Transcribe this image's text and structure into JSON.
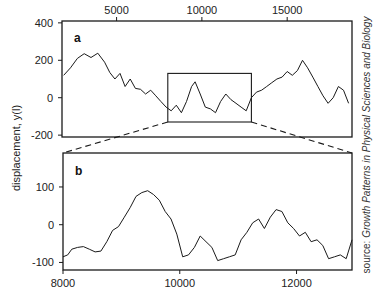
{
  "chart_data": [
    {
      "panel": "a",
      "type": "line",
      "title": "",
      "xlabel": "",
      "ylabel": "displacement, y(l)",
      "x_ticks": [
        5000,
        10000,
        15000
      ],
      "x_tick_labels": [
        "5000",
        "10000",
        "15000"
      ],
      "x_axis_position": "top",
      "y_ticks": [
        400,
        200,
        0,
        -200
      ],
      "y_tick_labels": [
        "400",
        "200",
        "0",
        "-200"
      ],
      "xlim": [
        1800,
        18800
      ],
      "ylim": [
        -210,
        410
      ],
      "grid": false,
      "inset_box": {
        "x_range": [
          8000,
          12900
        ],
        "y_range": [
          -130,
          130
        ]
      },
      "x": [
        1900,
        2300,
        2700,
        3100,
        3500,
        3900,
        4300,
        4600,
        4900,
        5200,
        5500,
        5800,
        6100,
        6400,
        6700,
        7000,
        7300,
        7600,
        7900,
        8200,
        8500,
        8800,
        9100,
        9400,
        9600,
        9900,
        10200,
        10500,
        10800,
        11100,
        11400,
        11700,
        12000,
        12300,
        12600,
        12900,
        13200,
        13500,
        13800,
        14100,
        14400,
        14700,
        15000,
        15300,
        15600,
        15900,
        16200,
        16500,
        16800,
        17100,
        17400,
        17700,
        18000,
        18300,
        18600
      ],
      "y": [
        120,
        160,
        210,
        235,
        215,
        238,
        190,
        135,
        100,
        130,
        60,
        100,
        50,
        45,
        20,
        40,
        10,
        -20,
        -50,
        -70,
        -40,
        -80,
        -20,
        60,
        85,
        20,
        -50,
        -60,
        -80,
        -20,
        20,
        -10,
        -30,
        -50,
        -70,
        0,
        30,
        40,
        60,
        80,
        100,
        110,
        140,
        120,
        145,
        200,
        160,
        110,
        60,
        10,
        -30,
        0,
        60,
        40,
        -30
      ]
    },
    {
      "panel": "b",
      "type": "line",
      "title": "",
      "xlabel": "",
      "ylabel": "displacement, y(l)",
      "x_ticks": [
        8000,
        10000,
        12000
      ],
      "x_tick_labels": [
        "8000",
        "10000",
        "12000"
      ],
      "x_axis_position": "bottom",
      "y_ticks": [
        100,
        0,
        -100
      ],
      "y_tick_labels": [
        "100",
        "0",
        "-100"
      ],
      "xlim": [
        8000,
        12950
      ],
      "ylim": [
        -120,
        190
      ],
      "grid": false,
      "x": [
        8000,
        8080,
        8150,
        8250,
        8350,
        8450,
        8550,
        8650,
        8750,
        8850,
        8950,
        9050,
        9150,
        9250,
        9350,
        9450,
        9550,
        9650,
        9750,
        9850,
        9950,
        10050,
        10150,
        10250,
        10350,
        10450,
        10550,
        10650,
        10750,
        10850,
        10950,
        11050,
        11150,
        11250,
        11350,
        11450,
        11550,
        11650,
        11750,
        11850,
        11950,
        12050,
        12150,
        12250,
        12350,
        12450,
        12550,
        12650,
        12750,
        12850,
        12950
      ],
      "y": [
        -85,
        -80,
        -65,
        -60,
        -58,
        -65,
        -72,
        -70,
        -45,
        -15,
        -5,
        20,
        45,
        75,
        85,
        90,
        80,
        65,
        35,
        15,
        -25,
        -85,
        -80,
        -60,
        -30,
        -45,
        -60,
        -95,
        -90,
        -85,
        -80,
        -40,
        -20,
        5,
        15,
        -10,
        20,
        40,
        35,
        5,
        -10,
        -30,
        -20,
        -45,
        -40,
        -55,
        -90,
        -85,
        -80,
        -90,
        -40
      ]
    }
  ],
  "labels": {
    "panel_a": "a",
    "panel_b": "b",
    "y_axis_title": "displacement, y(l)",
    "source_prefix": "source: ",
    "source_title": "Growth Patterns in Physical Sciences and Biology"
  },
  "colors": {
    "line": "#1a1a1a",
    "frame": "#1a1a1a",
    "background": "#ffffff"
  }
}
